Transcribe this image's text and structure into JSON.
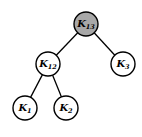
{
  "diagram": {
    "type": "binary-tree",
    "root_fill": "#a8a8a8",
    "node_fill": "#ffffff",
    "nodes": [
      {
        "id": "K13",
        "base": "K",
        "sub": "13",
        "highlighted": true
      },
      {
        "id": "K12",
        "base": "K",
        "sub": "12",
        "highlighted": false
      },
      {
        "id": "K3",
        "base": "K",
        "sub": "3",
        "highlighted": false
      },
      {
        "id": "K1",
        "base": "K",
        "sub": "1",
        "highlighted": false
      },
      {
        "id": "K2",
        "base": "K",
        "sub": "2",
        "highlighted": false
      }
    ],
    "edges": [
      {
        "from": "K13",
        "to": "K12"
      },
      {
        "from": "K13",
        "to": "K3"
      },
      {
        "from": "K12",
        "to": "K1"
      },
      {
        "from": "K12",
        "to": "K2"
      }
    ]
  }
}
